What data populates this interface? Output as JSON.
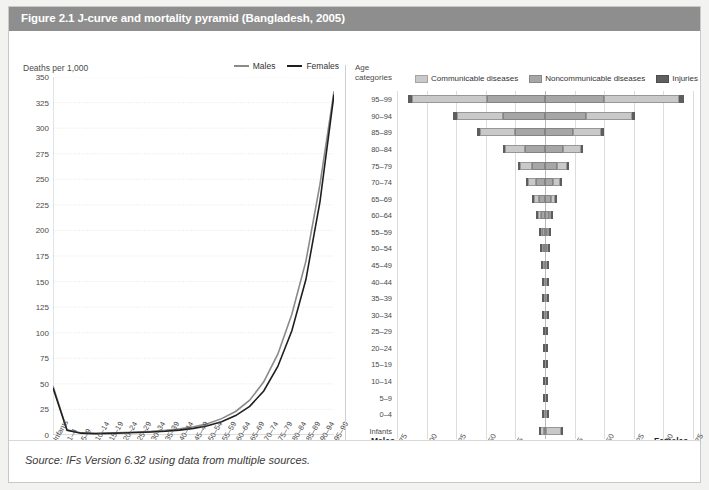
{
  "figure": {
    "title": "Figure 2.1 J-curve and mortality pyramid (Bangladesh, 2005)",
    "source": "Source: IFs Version 6.32 using data from multiple sources.",
    "title_bar_color": "#8e8e8e"
  },
  "colors": {
    "males_line": "#8a8a8a",
    "females_line": "#1f1f1f",
    "communicable": "#c9c9c9",
    "noncommunicable": "#a6a6a6",
    "injuries": "#5f5f5f",
    "grid": "#dcdcdc",
    "axis": "#b9b9b9"
  },
  "chart_data": [
    {
      "type": "line",
      "title": "J-curve",
      "xlabel": "Age categories",
      "ylabel": "Deaths per 1,000",
      "ylim": [
        0,
        350
      ],
      "yticks": [
        350,
        325,
        300,
        275,
        250,
        225,
        200,
        175,
        150,
        125,
        100,
        75,
        50,
        25,
        0
      ],
      "grid": true,
      "legend_position": "top-right",
      "categories": [
        "Infants",
        "1–4",
        "5–9",
        "10–14",
        "15–19",
        "20–24",
        "25–29",
        "30–34",
        "35–39",
        "40–44",
        "45–49",
        "50–54",
        "55–59",
        "60–64",
        "65–69",
        "70–74",
        "75–79",
        "80–84",
        "85–89",
        "90–94",
        "95–99"
      ],
      "series": [
        {
          "name": "Males",
          "values": [
            48,
            5,
            2,
            1.5,
            2,
            2.5,
            3,
            3.5,
            4.5,
            6,
            8,
            11,
            16,
            23,
            34,
            52,
            79,
            118,
            170,
            245,
            336
          ]
        },
        {
          "name": "Females",
          "values": [
            46,
            4.5,
            1.8,
            1.3,
            1.6,
            2,
            2.4,
            2.9,
            3.6,
            4.8,
            6.5,
            9,
            13,
            19,
            28,
            43,
            67,
            102,
            152,
            228,
            333
          ]
        }
      ]
    },
    {
      "type": "bar",
      "subtype": "population-pyramid",
      "title": "Mortality pyramid",
      "xlabel": "Deaths per 1,000",
      "ylabel": "Age categories",
      "left_label": "Males",
      "right_label": "Females",
      "xlim": [
        -375,
        375
      ],
      "xticks": [
        375,
        300,
        225,
        150,
        75,
        0,
        75,
        150,
        225,
        300,
        375
      ],
      "grid": true,
      "legend_position": "top",
      "legend": [
        "Communicable diseases",
        "Noncommunicable diseases",
        "Injuries"
      ],
      "categories": [
        "95–99",
        "90–94",
        "85–89",
        "80–84",
        "75–79",
        "70–74",
        "65–69",
        "60–64",
        "55–59",
        "50–54",
        "45–49",
        "40–44",
        "35–39",
        "30–34",
        "25–29",
        "20–24",
        "15–19",
        "10–14",
        "5–9",
        "0–4",
        "Infants"
      ],
      "males": [
        {
          "noncommunicable": 148,
          "communicable": 188,
          "injuries": 12
        },
        {
          "noncommunicable": 106,
          "communicable": 118,
          "injuries": 10
        },
        {
          "noncommunicable": 76,
          "communicable": 88,
          "injuries": 8
        },
        {
          "noncommunicable": 51,
          "communicable": 50,
          "injuries": 6
        },
        {
          "noncommunicable": 34,
          "communicable": 30,
          "injuries": 5
        },
        {
          "noncommunicable": 24,
          "communicable": 19,
          "injuries": 4
        },
        {
          "noncommunicable": 16,
          "communicable": 12,
          "injuries": 4
        },
        {
          "noncommunicable": 11,
          "communicable": 8,
          "injuries": 3
        },
        {
          "noncommunicable": 7,
          "communicable": 5,
          "injuries": 3
        },
        {
          "noncommunicable": 5,
          "communicable": 4,
          "injuries": 3
        },
        {
          "noncommunicable": 4,
          "communicable": 3,
          "injuries": 3
        },
        {
          "noncommunicable": 3,
          "communicable": 2,
          "injuries": 3
        },
        {
          "noncommunicable": 2,
          "communicable": 2,
          "injuries": 3
        },
        {
          "noncommunicable": 2,
          "communicable": 2,
          "injuries": 3
        },
        {
          "noncommunicable": 1.5,
          "communicable": 1.5,
          "injuries": 3
        },
        {
          "noncommunicable": 1.5,
          "communicable": 1.5,
          "injuries": 3
        },
        {
          "noncommunicable": 1,
          "communicable": 1.5,
          "injuries": 3
        },
        {
          "noncommunicable": 1,
          "communicable": 1.5,
          "injuries": 2
        },
        {
          "noncommunicable": 1,
          "communicable": 2,
          "injuries": 2
        },
        {
          "noncommunicable": 1.5,
          "communicable": 4,
          "injuries": 2
        },
        {
          "noncommunicable": 3,
          "communicable": 9,
          "injuries": 2
        }
      ],
      "females": [
        {
          "noncommunicable": 150,
          "communicable": 190,
          "injuries": 12
        },
        {
          "noncommunicable": 104,
          "communicable": 116,
          "injuries": 9
        },
        {
          "noncommunicable": 70,
          "communicable": 72,
          "injuries": 8
        },
        {
          "noncommunicable": 46,
          "communicable": 44,
          "injuries": 6
        },
        {
          "noncommunicable": 30,
          "communicable": 26,
          "injuries": 5
        },
        {
          "noncommunicable": 21,
          "communicable": 17,
          "injuries": 4
        },
        {
          "noncommunicable": 14,
          "communicable": 11,
          "injuries": 4
        },
        {
          "noncommunicable": 9,
          "communicable": 7,
          "injuries": 3
        },
        {
          "noncommunicable": 6,
          "communicable": 5,
          "injuries": 3
        },
        {
          "noncommunicable": 4,
          "communicable": 4,
          "injuries": 3
        },
        {
          "noncommunicable": 3,
          "communicable": 3,
          "injuries": 3
        },
        {
          "noncommunicable": 2.5,
          "communicable": 2,
          "injuries": 3
        },
        {
          "noncommunicable": 2,
          "communicable": 2,
          "injuries": 3
        },
        {
          "noncommunicable": 2,
          "communicable": 2,
          "injuries": 3
        },
        {
          "noncommunicable": 1.5,
          "communicable": 1.5,
          "injuries": 3
        },
        {
          "noncommunicable": 1.5,
          "communicable": 1.5,
          "injuries": 3
        },
        {
          "noncommunicable": 1,
          "communicable": 1.5,
          "injuries": 3
        },
        {
          "noncommunicable": 1,
          "communicable": 1.5,
          "injuries": 2
        },
        {
          "noncommunicable": 1,
          "communicable": 2,
          "injuries": 2
        },
        {
          "noncommunicable": 1.5,
          "communicable": 4,
          "injuries": 2
        },
        {
          "noncommunicable": 3,
          "communicable": 38,
          "injuries": 2
        }
      ]
    }
  ],
  "right_panel": {
    "age_header_line1": "Age",
    "age_header_line2": "categories"
  }
}
